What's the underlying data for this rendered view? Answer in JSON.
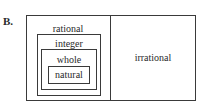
{
  "label": "B.",
  "sets": {
    "outer": "rational",
    "level2": "integer",
    "level3": "whole",
    "inner": "natural",
    "right": "irrational"
  }
}
